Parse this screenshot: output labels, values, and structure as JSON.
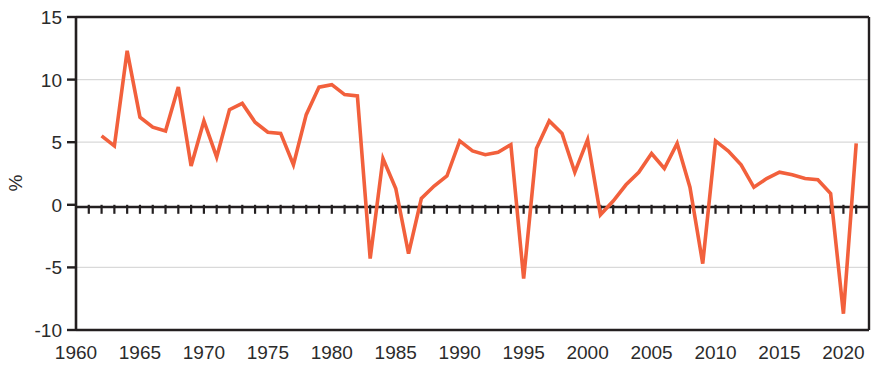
{
  "chart_data": {
    "type": "line",
    "title": "",
    "subtitle": "",
    "xlabel": "",
    "ylabel": "%",
    "xlim": [
      1960,
      2022
    ],
    "ylim": [
      -10,
      15
    ],
    "grid": true,
    "grid_axis": "y",
    "legend": false,
    "legend_position": "none",
    "line_color": "#F2603C",
    "axis_color": "#231f20",
    "grid_color": "#d9d9d9",
    "zero_line": 0,
    "y_ticks": [
      -10,
      -5,
      0,
      5,
      10,
      15
    ],
    "y_tick_labels": [
      "-10",
      "-5",
      "0",
      "5",
      "10",
      "15"
    ],
    "x_ticks": [
      1960,
      1965,
      1970,
      1975,
      1980,
      1985,
      1990,
      1995,
      2000,
      2005,
      2010,
      2015,
      2020
    ],
    "x_tick_labels": [
      "1960",
      "1965",
      "1970",
      "1975",
      "1980",
      "1985",
      "1990",
      "1995",
      "2000",
      "2005",
      "2010",
      "2015",
      "2020"
    ],
    "x_minor_tick_step": 1,
    "series": [
      {
        "name": "annual-growth",
        "color": "#F2603C",
        "x": [
          1962,
          1963,
          1964,
          1965,
          1966,
          1967,
          1968,
          1969,
          1970,
          1971,
          1972,
          1973,
          1974,
          1975,
          1976,
          1977,
          1978,
          1979,
          1980,
          1981,
          1982,
          1983,
          1984,
          1985,
          1986,
          1987,
          1988,
          1989,
          1990,
          1991,
          1992,
          1993,
          1994,
          1995,
          1996,
          1997,
          1998,
          1999,
          2000,
          2001,
          2002,
          2003,
          2004,
          2005,
          2006,
          2007,
          2008,
          2009,
          2010,
          2011,
          2012,
          2013,
          2014,
          2015,
          2016,
          2017,
          2018,
          2019,
          2020,
          2021
        ],
        "values": [
          5.5,
          4.7,
          12.3,
          7.0,
          6.2,
          5.9,
          9.4,
          3.1,
          6.7,
          3.8,
          7.6,
          8.1,
          6.6,
          5.8,
          5.7,
          3.2,
          7.2,
          9.4,
          9.6,
          8.8,
          8.7,
          -4.3,
          3.7,
          1.3,
          -3.9,
          0.5,
          1.5,
          2.3,
          5.1,
          4.3,
          4.0,
          4.2,
          4.8,
          -5.9,
          4.5,
          6.7,
          5.7,
          2.6,
          5.2,
          -0.8,
          0.3,
          1.6,
          2.6,
          4.1,
          2.9,
          4.9,
          1.4,
          -4.7,
          5.1,
          4.3,
          3.2,
          1.4,
          2.1,
          2.6,
          2.4,
          2.1,
          2.0,
          0.9,
          -8.7,
          4.9
        ]
      }
    ]
  },
  "axis": {
    "y_label": "%"
  }
}
